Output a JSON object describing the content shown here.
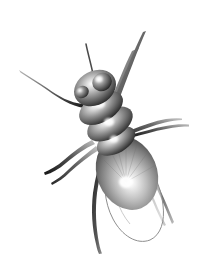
{
  "canvas": {
    "width": 198,
    "height": 261,
    "background_color": "#ffffff",
    "title": "Fly Illustration",
    "subject": "housefly-dorsal-view",
    "style": "grayscale-airbrush-render",
    "visible_text": ""
  },
  "palette": {
    "background": "#ffffff",
    "body_dark": "#2b2b2b",
    "body_mid": "#6e6e6e",
    "body_light": "#d6d6d6",
    "highlight": "#ffffff",
    "abdomen_dark": "#5a5a5a",
    "abdomen_light": "#f2f2f2",
    "leg_dark": "#1c1c1c",
    "leg_mid": "#555555",
    "leg_tip": "#9a9a9a",
    "wing_outline": "#8e8e8e",
    "wing_fill": "#ffffff",
    "eye_dark": "#3a3a3a",
    "eye_light": "#c8c8c8",
    "bristle": "#4a4a4a"
  },
  "anatomy": {
    "head": {
      "label": "head",
      "center_x": 95,
      "center_y": 88,
      "rx": 22,
      "ry": 17,
      "rotation_deg": -28,
      "highlight_x": 98,
      "highlight_y": 80
    },
    "eyes": [
      {
        "label": "left-compound-eye",
        "center_x": 82,
        "center_y": 92,
        "rx": 7,
        "ry": 6,
        "rotation_deg": -28
      },
      {
        "label": "right-compound-eye",
        "center_x": 102,
        "center_y": 82,
        "rx": 10,
        "ry": 9,
        "rotation_deg": -28
      }
    ],
    "thorax_segments": [
      {
        "label": "thorax-segment-1",
        "center_x": 101,
        "center_y": 108,
        "rx": 24,
        "ry": 14,
        "rotation_deg": -30,
        "highlight_x": 100,
        "highlight_y": 104
      },
      {
        "label": "thorax-segment-2",
        "center_x": 110,
        "center_y": 124,
        "rx": 25,
        "ry": 14,
        "rotation_deg": -30,
        "highlight_x": 109,
        "highlight_y": 122
      },
      {
        "label": "thorax-segment-3",
        "center_x": 116,
        "center_y": 141,
        "rx": 21,
        "ry": 12,
        "rotation_deg": -30,
        "highlight_x": 114,
        "highlight_y": 139
      }
    ],
    "abdomen": {
      "label": "abdomen",
      "center_x": 127,
      "center_y": 173,
      "rx": 30,
      "ry": 38,
      "rotation_deg": -22,
      "highlight_x": 126,
      "highlight_y": 182
    },
    "wing": {
      "label": "wing",
      "outline_only": true,
      "tip_x": 146,
      "tip_y": 238
    },
    "antenna": {
      "label": "antenna-bristle",
      "from_x": 93,
      "from_y": 74,
      "to_x": 86,
      "to_y": 44
    },
    "legs": [
      {
        "label": "leg-front-left",
        "side": "left",
        "position": "front",
        "tip_x": 18,
        "tip_y": 70
      },
      {
        "label": "leg-mid-left",
        "side": "left",
        "position": "middle",
        "tip_x": 44,
        "tip_y": 173
      },
      {
        "label": "leg-hind-left",
        "side": "left",
        "position": "hind",
        "tip_x": 110,
        "tip_y": 253
      },
      {
        "label": "leg-front-right",
        "side": "right",
        "position": "front",
        "tip_x": 146,
        "tip_y": 31
      },
      {
        "label": "leg-mid-right",
        "side": "right",
        "position": "middle",
        "tip_x": 189,
        "tip_y": 125
      },
      {
        "label": "leg-hind-right",
        "side": "right",
        "position": "hind",
        "tip_x": 171,
        "tip_y": 225
      }
    ]
  }
}
